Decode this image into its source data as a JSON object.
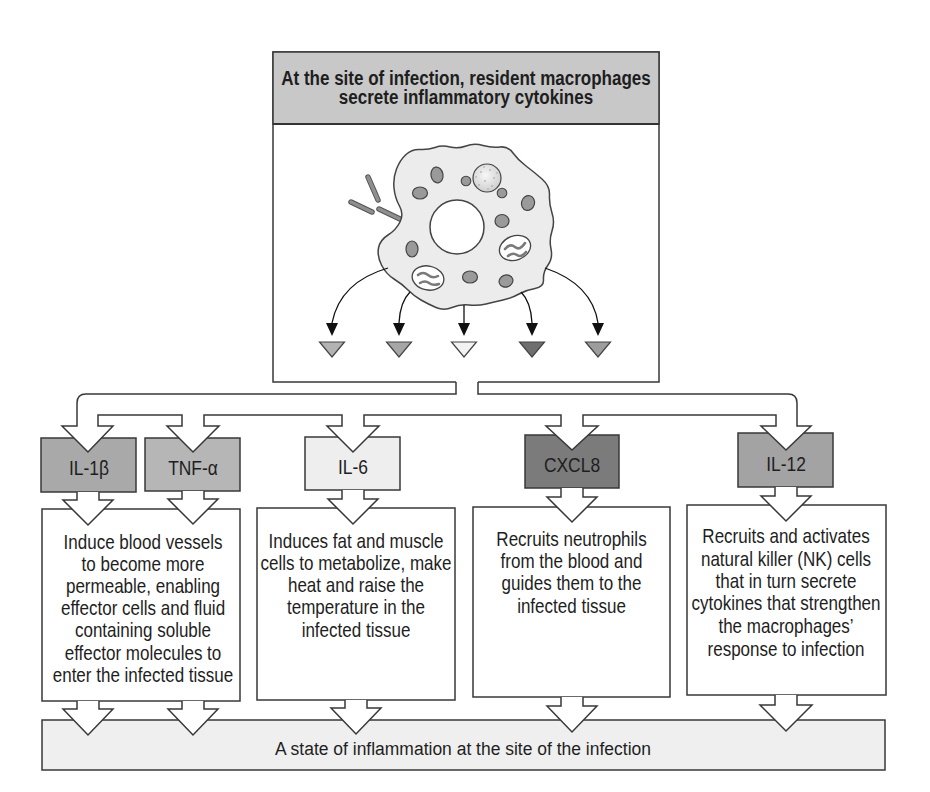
{
  "header": {
    "title_lines": [
      "At the site of infection, resident macrophages",
      "secrete inflammatory cytokines"
    ],
    "background_color": "#c8c8c8"
  },
  "illustration": {
    "subject": "macrophage",
    "secreted_markers": [
      {
        "color": "#b3b3b3"
      },
      {
        "color": "#a6a6a6"
      },
      {
        "color": "#f2f2f2"
      },
      {
        "color": "#6f6f6f"
      },
      {
        "color": "#9d9d9d"
      }
    ]
  },
  "cytokines": [
    {
      "label": "IL-1β",
      "color": "#a9a9a9"
    },
    {
      "label": "TNF-α",
      "color": "#b6b6b6"
    },
    {
      "label": "IL-6",
      "color": "#eeeeee"
    },
    {
      "label": "CXCL8",
      "color": "#7b7b7b"
    },
    {
      "label": "IL-12",
      "color": "#a3a3a3"
    }
  ],
  "effects": [
    {
      "lines": [
        "Induce blood vessels",
        "to become more",
        "permeable, enabling",
        "effector cells and fluid",
        "containing soluble",
        "effector molecules to",
        "enter the infected tissue"
      ]
    },
    {
      "lines": [
        "Induces fat and muscle",
        "cells to metabolize, make",
        "heat and raise the",
        "temperature in the",
        "infected tissue"
      ]
    },
    {
      "lines": [
        "Recruits neutrophils",
        "from the blood and",
        "guides them to the",
        "infected tissue"
      ]
    },
    {
      "lines": [
        "Recruits and activates",
        "natural killer (NK) cells",
        "that in turn secrete",
        "cytokines that strengthen",
        "the macrophages’",
        "response to infection"
      ]
    }
  ],
  "outcome": {
    "text": "A state of inflammation at the site of the infection",
    "background_color": "#efefef"
  }
}
